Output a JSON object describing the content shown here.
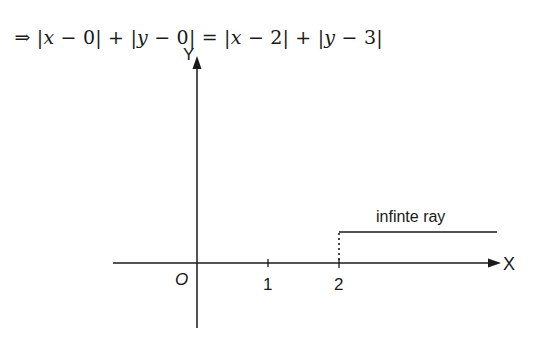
{
  "equation": {
    "implies": "⇒",
    "parts": [
      {
        "type": "text",
        "value": " |"
      },
      {
        "type": "var",
        "value": "x"
      },
      {
        "type": "text",
        "value": " − 0| + |"
      },
      {
        "type": "var",
        "value": "y"
      },
      {
        "type": "text",
        "value": " − 0| = |"
      },
      {
        "type": "var",
        "value": "x"
      },
      {
        "type": "text",
        "value": " − 2| + |"
      },
      {
        "type": "var",
        "value": "y"
      },
      {
        "type": "text",
        "value": " − 3|"
      }
    ]
  },
  "diagram": {
    "y_axis_label": "Y",
    "x_axis_label": "X",
    "origin_label": "O",
    "ticks": [
      {
        "label": "1",
        "value": 1
      },
      {
        "label": "2",
        "value": 2
      }
    ],
    "ray_label": "infinte ray",
    "ray": {
      "start_x": 2,
      "y": 3,
      "direction": "positive-x"
    },
    "colors": {
      "line": "#1a1a1a",
      "background": "#ffffff"
    }
  }
}
